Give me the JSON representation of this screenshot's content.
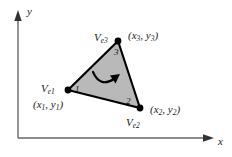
{
  "figure": {
    "background_color": "#ffffff",
    "element_fill_color": "#b9b9b9",
    "edge_color": "#000000",
    "node_color": "#000000"
  },
  "axes": {
    "x_label": "x",
    "y_label": "y",
    "axis_color": "#555555",
    "origin": {
      "x": 18,
      "y": 138
    },
    "x_axis_end": {
      "x": 214,
      "y": 138
    },
    "y_axis_end": {
      "x": 18,
      "y": 12
    }
  },
  "element": {
    "orientation_arrow": "counterclockwise-curved-arrow",
    "vertices": [
      {
        "node_number": "1",
        "vertex_label": "V",
        "vertex_subscript": "e1",
        "coord_label_open": "(",
        "coord_x": "x",
        "coord_x_sub": "1",
        "coord_sep": ", ",
        "coord_y": "y",
        "coord_y_sub": "1",
        "coord_label_close": ")",
        "px": 68,
        "py": 90
      },
      {
        "node_number": "2",
        "vertex_label": "V",
        "vertex_subscript": "e2",
        "coord_label_open": "(",
        "coord_x": "x",
        "coord_x_sub": "2",
        "coord_sep": ", ",
        "coord_y": "y",
        "coord_y_sub": "2",
        "coord_label_close": ")",
        "px": 140,
        "py": 108
      },
      {
        "node_number": "3",
        "vertex_label": "V",
        "vertex_subscript": "e3",
        "coord_label_open": "(",
        "coord_x": "x",
        "coord_x_sub": "3",
        "coord_sep": ", ",
        "coord_y": "y",
        "coord_y_sub": "3",
        "coord_label_close": ")",
        "px": 118,
        "py": 41
      }
    ]
  }
}
